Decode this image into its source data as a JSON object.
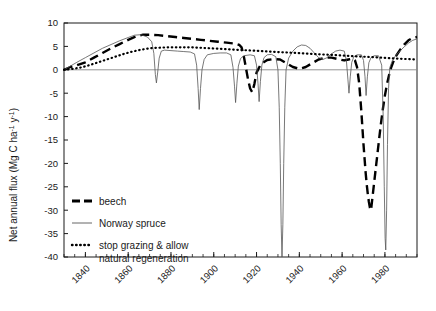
{
  "chart_data": {
    "type": "line",
    "title": "",
    "subtitle": "",
    "xlabel": "",
    "ylabel_parts": {
      "main": "Net annual flux (Mg C ha",
      "sup1": "-1",
      "mid": " y",
      "sup2": "-1",
      "end": ")"
    },
    "ylabel": "Net annual flux (Mg C ha-1 y-1)",
    "xlim": [
      1830,
      1995
    ],
    "ylim": [
      -40,
      10
    ],
    "ytick_values": [
      10,
      5,
      0,
      -5,
      -10,
      -15,
      -20,
      -25,
      -30,
      -35,
      -40
    ],
    "ytick_labels": [
      "10",
      "5",
      "0",
      "-5",
      "-10",
      "-15",
      "-20",
      "-25",
      "-30",
      "-35",
      "-40"
    ],
    "xtick_values": [
      1840,
      1860,
      1880,
      1900,
      1920,
      1940,
      1960,
      1980
    ],
    "xtick_labels": [
      "1840",
      "1860",
      "1880",
      "1900",
      "1920",
      "1940",
      "1960",
      "1980"
    ],
    "xminor_step": 5,
    "grid": false,
    "zero_line": true,
    "legend_position": "inside-lower-left",
    "series": [
      {
        "name": "beech",
        "style": "dashed",
        "color": "#000000",
        "width": 2.4,
        "points": [
          [
            1830,
            0.0
          ],
          [
            1833,
            0.6
          ],
          [
            1836,
            1.0
          ],
          [
            1840,
            1.6
          ],
          [
            1844,
            2.6
          ],
          [
            1848,
            3.6
          ],
          [
            1852,
            4.6
          ],
          [
            1856,
            5.5
          ],
          [
            1860,
            6.4
          ],
          [
            1864,
            7.2
          ],
          [
            1867,
            7.5
          ],
          [
            1870,
            7.5
          ],
          [
            1874,
            7.4
          ],
          [
            1878,
            7.2
          ],
          [
            1882,
            7.0
          ],
          [
            1886,
            6.8
          ],
          [
            1890,
            6.6
          ],
          [
            1894,
            6.4
          ],
          [
            1898,
            6.2
          ],
          [
            1902,
            6.0
          ],
          [
            1906,
            5.8
          ],
          [
            1910,
            5.6
          ],
          [
            1912,
            5.3
          ],
          [
            1913,
            4.8
          ],
          [
            1914,
            3.0
          ],
          [
            1915,
            0.5
          ],
          [
            1916,
            -2.0
          ],
          [
            1917,
            -4.0
          ],
          [
            1918,
            -4.8
          ],
          [
            1919,
            -3.0
          ],
          [
            1920,
            -0.6
          ],
          [
            1922,
            1.2
          ],
          [
            1925,
            2.1
          ],
          [
            1928,
            2.3
          ],
          [
            1931,
            2.2
          ],
          [
            1934,
            1.4
          ],
          [
            1937,
            0.6
          ],
          [
            1940,
            0.2
          ],
          [
            1943,
            0.6
          ],
          [
            1946,
            1.4
          ],
          [
            1949,
            2.2
          ],
          [
            1952,
            2.6
          ],
          [
            1955,
            2.6
          ],
          [
            1958,
            2.3
          ],
          [
            1961,
            2.0
          ],
          [
            1963,
            2.2
          ],
          [
            1965,
            2.4
          ],
          [
            1966,
            2.0
          ],
          [
            1967,
            0.5
          ],
          [
            1968,
            -3.0
          ],
          [
            1969,
            -9.0
          ],
          [
            1970,
            -16.0
          ],
          [
            1970.5,
            -19.0
          ],
          [
            1971,
            -22.0
          ],
          [
            1971.5,
            -24.5
          ],
          [
            1972,
            -26.5
          ],
          [
            1972.5,
            -28.2
          ],
          [
            1973,
            -29.5
          ],
          [
            1973.5,
            -30.0
          ],
          [
            1974,
            -28.0
          ],
          [
            1975,
            -24.0
          ],
          [
            1976,
            -20.0
          ],
          [
            1977,
            -16.0
          ],
          [
            1978,
            -12.0
          ],
          [
            1979,
            -8.5
          ],
          [
            1980,
            -5.5
          ],
          [
            1981,
            -3.0
          ],
          [
            1982,
            -1.0
          ],
          [
            1983,
            0.6
          ],
          [
            1984,
            1.8
          ],
          [
            1985,
            2.8
          ],
          [
            1987,
            4.2
          ],
          [
            1989,
            5.4
          ],
          [
            1991,
            6.3
          ],
          [
            1993,
            6.8
          ],
          [
            1995,
            7.0
          ]
        ]
      },
      {
        "name": "Norway spruce",
        "style": "solid-thin",
        "color": "#555555",
        "width": 0.8,
        "points": [
          [
            1830,
            0.0
          ],
          [
            1833,
            0.8
          ],
          [
            1836,
            1.6
          ],
          [
            1840,
            2.6
          ],
          [
            1844,
            3.6
          ],
          [
            1848,
            4.6
          ],
          [
            1852,
            5.4
          ],
          [
            1856,
            6.2
          ],
          [
            1860,
            6.9
          ],
          [
            1863,
            7.4
          ],
          [
            1866,
            7.5
          ],
          [
            1869,
            7.0
          ],
          [
            1871,
            6.0
          ],
          [
            1872,
            3.5
          ],
          [
            1872.7,
            -1.0
          ],
          [
            1873.2,
            -2.8
          ],
          [
            1873.8,
            -0.5
          ],
          [
            1874.5,
            2.5
          ],
          [
            1875.5,
            4.0
          ],
          [
            1877,
            4.2
          ],
          [
            1880,
            4.1
          ],
          [
            1883,
            4.0
          ],
          [
            1886,
            3.9
          ],
          [
            1889,
            3.8
          ],
          [
            1891,
            3.4
          ],
          [
            1892,
            1.0
          ],
          [
            1892.7,
            -4.0
          ],
          [
            1893.2,
            -8.5
          ],
          [
            1893.8,
            -4.0
          ],
          [
            1894.5,
            0.0
          ],
          [
            1895.5,
            2.2
          ],
          [
            1897,
            3.2
          ],
          [
            1900,
            3.5
          ],
          [
            1903,
            3.6
          ],
          [
            1906,
            3.6
          ],
          [
            1908,
            3.2
          ],
          [
            1909,
            0.5
          ],
          [
            1909.7,
            -3.5
          ],
          [
            1910.2,
            -7.0
          ],
          [
            1910.8,
            -3.0
          ],
          [
            1911.5,
            0.8
          ],
          [
            1912.5,
            2.4
          ],
          [
            1914,
            3.0
          ],
          [
            1917,
            3.2
          ],
          [
            1919,
            3.0
          ],
          [
            1920,
            1.0
          ],
          [
            1920.7,
            -3.0
          ],
          [
            1921.2,
            -6.8
          ],
          [
            1921.8,
            -2.5
          ],
          [
            1922.5,
            1.0
          ],
          [
            1923.5,
            2.6
          ],
          [
            1925,
            3.2
          ],
          [
            1927,
            3.3
          ],
          [
            1929,
            2.8
          ],
          [
            1930,
            0.0
          ],
          [
            1930.6,
            -8.0
          ],
          [
            1931.1,
            -20.0
          ],
          [
            1931.5,
            -33.0
          ],
          [
            1931.9,
            -40.0
          ],
          [
            1932.3,
            -33.0
          ],
          [
            1932.7,
            -20.0
          ],
          [
            1933.2,
            -8.0
          ],
          [
            1933.8,
            0.0
          ],
          [
            1935,
            2.5
          ],
          [
            1937,
            4.0
          ],
          [
            1939,
            4.9
          ],
          [
            1941,
            5.3
          ],
          [
            1943,
            5.2
          ],
          [
            1945,
            4.6
          ],
          [
            1947,
            3.6
          ],
          [
            1949,
            2.6
          ],
          [
            1951,
            2.2
          ],
          [
            1953,
            2.6
          ],
          [
            1955,
            3.4
          ],
          [
            1957,
            4.0
          ],
          [
            1959,
            4.2
          ],
          [
            1961,
            4.0
          ],
          [
            1962,
            2.0
          ],
          [
            1962.7,
            -2.0
          ],
          [
            1963.2,
            -5.0
          ],
          [
            1963.8,
            -1.5
          ],
          [
            1964.5,
            1.6
          ],
          [
            1965.5,
            2.8
          ],
          [
            1967,
            3.2
          ],
          [
            1969,
            3.2
          ],
          [
            1970,
            2.0
          ],
          [
            1970.7,
            -1.5
          ],
          [
            1971.2,
            -5.5
          ],
          [
            1971.8,
            -1.5
          ],
          [
            1972.5,
            1.5
          ],
          [
            1973.5,
            2.6
          ],
          [
            1975,
            3.0
          ],
          [
            1977,
            3.0
          ],
          [
            1978.5,
            1.0
          ],
          [
            1979.2,
            -10.0
          ],
          [
            1979.7,
            -25.0
          ],
          [
            1980.1,
            -36.0
          ],
          [
            1980.4,
            -38.5
          ],
          [
            1980.8,
            -30.0
          ],
          [
            1981.2,
            -16.0
          ],
          [
            1981.7,
            -4.0
          ],
          [
            1982.3,
            0.5
          ],
          [
            1983.5,
            2.0
          ],
          [
            1985,
            3.0
          ],
          [
            1987,
            4.0
          ],
          [
            1989,
            4.9
          ],
          [
            1991,
            5.7
          ],
          [
            1993,
            6.3
          ],
          [
            1995,
            6.6
          ]
        ]
      },
      {
        "name": "stop grazing & allow natural regeneration",
        "style": "dotted",
        "color": "#000000",
        "width": 2.2,
        "points": [
          [
            1830,
            0.0
          ],
          [
            1834,
            0.2
          ],
          [
            1838,
            0.5
          ],
          [
            1842,
            1.0
          ],
          [
            1846,
            1.6
          ],
          [
            1850,
            2.2
          ],
          [
            1854,
            2.8
          ],
          [
            1858,
            3.4
          ],
          [
            1862,
            3.9
          ],
          [
            1866,
            4.3
          ],
          [
            1870,
            4.6
          ],
          [
            1874,
            4.7
          ],
          [
            1878,
            4.8
          ],
          [
            1882,
            4.8
          ],
          [
            1886,
            4.8
          ],
          [
            1890,
            4.8
          ],
          [
            1894,
            4.7
          ],
          [
            1898,
            4.6
          ],
          [
            1902,
            4.5
          ],
          [
            1906,
            4.4
          ],
          [
            1910,
            4.3
          ],
          [
            1914,
            4.2
          ],
          [
            1918,
            4.1
          ],
          [
            1922,
            4.0
          ],
          [
            1926,
            3.9
          ],
          [
            1930,
            3.8
          ],
          [
            1934,
            3.7
          ],
          [
            1938,
            3.6
          ],
          [
            1942,
            3.5
          ],
          [
            1946,
            3.4
          ],
          [
            1950,
            3.3
          ],
          [
            1954,
            3.2
          ],
          [
            1958,
            3.1
          ],
          [
            1962,
            3.0
          ],
          [
            1966,
            2.9
          ],
          [
            1970,
            2.8
          ],
          [
            1974,
            2.7
          ],
          [
            1978,
            2.6
          ],
          [
            1982,
            2.5
          ],
          [
            1986,
            2.4
          ],
          [
            1990,
            2.3
          ],
          [
            1995,
            2.2
          ]
        ]
      }
    ],
    "legend": [
      {
        "label": "beech",
        "style": "dashed"
      },
      {
        "label": "Norway spruce",
        "style": "solid-thin"
      },
      {
        "label": "stop grazing & allow",
        "label2": "natural regeneration",
        "style": "dotted"
      }
    ]
  },
  "colors": {
    "axis": "#1a1a1a",
    "beech": "#000000",
    "spruce": "#555555",
    "dotted": "#000000",
    "background": "#ffffff"
  }
}
